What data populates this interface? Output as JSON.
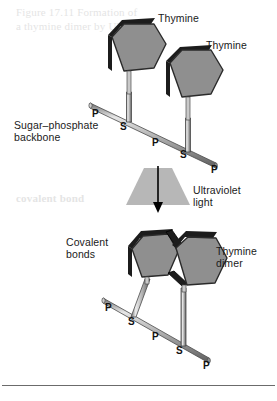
{
  "figure": {
    "title_alt": "Formation of a thymine dimer by ultraviolet light",
    "labels": {
      "thymine_top_left": "Thymine",
      "thymine_top_right": "Thymine",
      "sugar_phosphate_backbone": "Sugar–phosphate\nbackbone",
      "ultraviolet_light": "Ultraviolet\nlight",
      "covalent_bonds": "Covalent\nbonds",
      "thymine_dimer": "Thymine\ndimer"
    },
    "backbone_top": {
      "atoms": [
        {
          "symbol": "P",
          "x": 92,
          "y": 114
        },
        {
          "symbol": "S",
          "x": 120,
          "y": 127
        },
        {
          "symbol": "P",
          "x": 152,
          "y": 143
        },
        {
          "symbol": "S",
          "x": 180,
          "y": 155
        },
        {
          "symbol": "P",
          "x": 211,
          "y": 170
        }
      ]
    },
    "backbone_bottom": {
      "atoms": [
        {
          "symbol": "P",
          "x": 105,
          "y": 308
        },
        {
          "symbol": "S",
          "x": 128,
          "y": 322
        },
        {
          "symbol": "P",
          "x": 152,
          "y": 337
        },
        {
          "symbol": "S",
          "x": 176,
          "y": 351
        },
        {
          "symbol": "P",
          "x": 203,
          "y": 366
        }
      ]
    },
    "ghost_text": {
      "block_top": "Figure 17.11 Formation of\na thymine dimer by UV light",
      "block_mid": "covalent bond"
    }
  },
  "colors": {
    "base_fill": "#8f8f8f",
    "base_edge_dark": "#1c1c1c",
    "base_outline": "#2a2a2a",
    "backbone_light": "#d4d4d4",
    "backbone_mid": "#9a9a9a",
    "backbone_dark": "#5a5a5a",
    "uv_beam": "#b3b3b3",
    "arrow": "#000000",
    "text": "#1a1a1a",
    "rule": "#6b6b6b",
    "page_bg": "#ffffff"
  }
}
